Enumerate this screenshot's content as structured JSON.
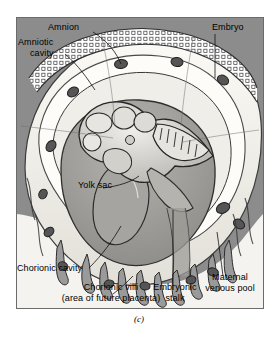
{
  "figure": {
    "caption": "(c)",
    "background_color": "#8c8c8c",
    "border_color": "#6b6b6b",
    "membrane_color": "#f2f0ea",
    "cavity_color": "#ffffff",
    "tissue_color": "#9a9a9a",
    "embryo_color": "#c9c7c2",
    "outline_color": "#2a2a2a"
  },
  "labels": {
    "amnion": "Amnion",
    "amniotic_cavity_line1": "Amniotic",
    "amniotic_cavity_line2": "cavity",
    "embryo": "Embryo",
    "yolk_sac": "Yolk sac",
    "chorionic_cavity": "Chorionic cavity",
    "chorionic_villi_line1": "Chorionic villi",
    "chorionic_villi_line2": "(area of future placenta)",
    "embryonic_stalk_line1": "Embryonic",
    "embryonic_stalk_line2": "stalk",
    "maternal_venous_pool_line1": "Maternal",
    "maternal_venous_pool_line2": "venous pool"
  }
}
